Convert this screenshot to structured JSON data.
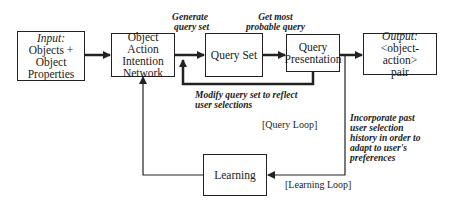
{
  "nodes": {
    "input": {
      "title": "Input:",
      "lines": [
        "Objects +",
        "Object",
        "Properties"
      ]
    },
    "oain": {
      "lines": [
        "Object Action",
        "Intention",
        "Network"
      ]
    },
    "query_set": {
      "lines": [
        "Query Set"
      ]
    },
    "query_presentation": {
      "lines": [
        "Query",
        "Presentation"
      ]
    },
    "output": {
      "title": "Output:",
      "lines": [
        "<object-action>",
        "pair"
      ]
    },
    "learning": {
      "lines": [
        "Learning"
      ]
    }
  },
  "edge_labels": {
    "generate": [
      "Generate",
      "query set"
    ],
    "get_most": [
      "Get most",
      "probable query"
    ],
    "modify": [
      "Modify query set to reflect",
      "user selections"
    ],
    "incorporate": [
      "Incorporate past",
      "user selection",
      "history in order to",
      "adapt to user's",
      "preferences"
    ]
  },
  "loop_labels": {
    "query_loop": "[Query Loop]",
    "learning_loop": "[Learning Loop]"
  }
}
